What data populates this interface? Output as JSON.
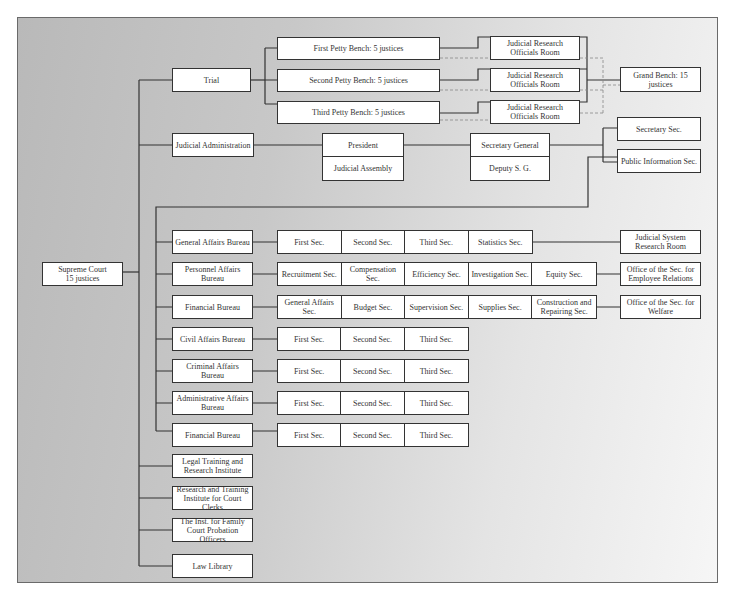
{
  "chart": {
    "root": "Supreme Court\n15 justices",
    "trial": {
      "label": "Trial",
      "benches": [
        "First Petty Bench: 5 justices",
        "Second Petty Bench: 5 justices",
        "Third Petty Bench: 5 justices"
      ],
      "research_rooms": [
        "Judicial Research Officials Room",
        "Judicial Research Officials Room",
        "Judicial Research Officials Room"
      ],
      "grand_bench": "Grand Bench: 15 justices"
    },
    "admin": {
      "label": "Judicial Administration",
      "president": "President",
      "assembly": "Judicial Assembly",
      "secretary_general": "Secretary General",
      "deputy": "Deputy S. G.",
      "secretary_sec": "Secretary Sec.",
      "public_info_sec": "Public Information Sec."
    },
    "bureaus": [
      {
        "name": "General Affairs Bureau",
        "sections": [
          "First Sec.",
          "Second Sec.",
          "Third Sec.",
          "Statistics Sec."
        ],
        "extra": "Judicial System Research Room"
      },
      {
        "name": "Personnel Affairs Bureau",
        "sections": [
          "Recruitment Sec.",
          "Compensation Sec.",
          "Efficiency Sec.",
          "Investigation Sec.",
          "Equity Sec."
        ],
        "extra": "Office of the Sec. for Employee Relations"
      },
      {
        "name": "Financial Bureau",
        "sections": [
          "General Affairs Sec.",
          "Budget Sec.",
          "Supervision Sec.",
          "Supplies Sec.",
          "Construction and Repairing Sec."
        ],
        "extra": "Office of the Sec. for Welfare"
      },
      {
        "name": "Civil Affairs Bureau",
        "sections": [
          "First Sec.",
          "Second Sec.",
          "Third Sec."
        ]
      },
      {
        "name": "Criminal Affairs Bureau",
        "sections": [
          "First Sec.",
          "Second Sec.",
          "Third Sec."
        ]
      },
      {
        "name": "Administrative Affairs Bureau",
        "sections": [
          "First Sec.",
          "Second Sec.",
          "Third Sec."
        ]
      },
      {
        "name": "Financial Bureau",
        "sections": [
          "First Sec.",
          "Second Sec.",
          "Third Sec."
        ]
      }
    ],
    "institutes": [
      "Legal Training and Research Institute",
      "Research and Training Institute for Court Clerks",
      "The Inst. for Family Court Probation Officers",
      "Law Library"
    ]
  }
}
